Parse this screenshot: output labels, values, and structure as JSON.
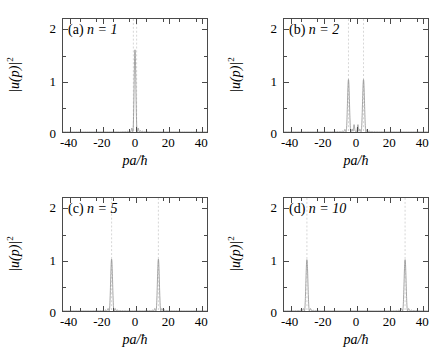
{
  "figure": {
    "background": "#ffffff",
    "curve_color": "#8c8c8c",
    "guide_color": "#b9b9b9",
    "axis_color": "#4a4a4a"
  },
  "axis": {
    "xlabel": "pa/ħ",
    "ylabel_base": "|u(p)|",
    "ylabel_exp": "2",
    "xticks": [
      -40,
      -20,
      0,
      20,
      40
    ],
    "xtick_labels": [
      "-40",
      "-20",
      "0",
      "20",
      "40"
    ],
    "yticks": [
      0,
      1,
      2
    ],
    "ytick_labels": [
      "0",
      "1",
      "2"
    ],
    "xlim": [
      -44,
      44
    ],
    "ylim": [
      0,
      2.2
    ],
    "x_minor_step": 10,
    "y_minor_step": 0.5
  },
  "chart_data": [
    {
      "type": "line",
      "panel": "a",
      "tag_id": "(a)",
      "tag_n": "n = 1",
      "n": 1,
      "title": "",
      "xlabel": "pa/ħ",
      "ylabel": "|u(p)|^2",
      "xlim": [
        -44,
        44
      ],
      "ylim": [
        0,
        2.2
      ],
      "grid": false,
      "legend": "none",
      "peak_centers": [
        0
      ],
      "peak_heights": [
        1.6
      ],
      "peak_width": 1.35,
      "guide_lines": [
        -1.0,
        1.0
      ],
      "sidelobe_amplitude": 0.012
    },
    {
      "type": "line",
      "panel": "b",
      "tag_id": "(b)",
      "tag_n": "n = 2",
      "n": 2,
      "title": "",
      "xlabel": "pa/ħ",
      "ylabel": "|u(p)|^2",
      "xlim": [
        -44,
        44
      ],
      "ylim": [
        0,
        2.2
      ],
      "grid": false,
      "legend": "none",
      "peak_centers": [
        -4.6,
        4.6
      ],
      "peak_heights": [
        1.02,
        1.02
      ],
      "peak_width": 1.5,
      "secondary_centers": [
        -1.2,
        1.2
      ],
      "secondary_heights": [
        0.13,
        0.13
      ],
      "secondary_width": 0.75,
      "guide_lines": [
        -4.6,
        4.6
      ],
      "sidelobe_amplitude": 0.014
    },
    {
      "type": "line",
      "panel": "c",
      "tag_id": "(c)",
      "tag_n": "n = 5",
      "n": 5,
      "title": "",
      "xlabel": "pa/ħ",
      "ylabel": "|u(p)|^2",
      "xlim": [
        -44,
        44
      ],
      "ylim": [
        0,
        2.2
      ],
      "grid": false,
      "legend": "none",
      "peak_centers": [
        -14.3,
        14.3
      ],
      "peak_heights": [
        1.01,
        1.01
      ],
      "peak_width": 1.5,
      "guide_lines": [
        -14.3,
        14.3
      ],
      "sidelobe_amplitude": 0.022
    },
    {
      "type": "line",
      "panel": "d",
      "tag_id": "(d)",
      "tag_n": "n = 10",
      "n": 10,
      "title": "",
      "xlabel": "pa/ħ",
      "ylabel": "|u(p)|^2",
      "xlim": [
        -44,
        44
      ],
      "ylim": [
        0,
        2.2
      ],
      "grid": false,
      "legend": "none",
      "peak_centers": [
        -30.0,
        30.0
      ],
      "peak_heights": [
        1.0,
        1.0
      ],
      "peak_width": 1.55,
      "guide_lines": [
        -30.0,
        30.0
      ],
      "sidelobe_amplitude": 0.024
    }
  ]
}
